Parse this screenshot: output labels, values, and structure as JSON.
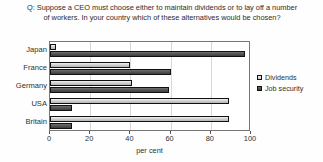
{
  "chart_data": {
    "type": "bar",
    "orientation": "horizontal",
    "title": "Q: Suppose a CEO must choose either to maintain dividends or to lay off a number of workers. In your country which of these alternatives would be chosen?",
    "xlabel": "per cent",
    "ylabel": "",
    "categories": [
      "Japan",
      "France",
      "Germany",
      "USA",
      "Britain"
    ],
    "series": [
      {
        "name": "Dividends",
        "values": [
          3,
          40,
          41,
          89,
          89
        ],
        "color": "#d2d2d2"
      },
      {
        "name": "Job security",
        "values": [
          97,
          60,
          59,
          11,
          11
        ],
        "color": "#4c4c4c"
      }
    ],
    "xlim": [
      0,
      100
    ],
    "xticks": [
      0,
      20,
      40,
      60,
      80,
      100
    ],
    "xtick_labels": [
      "0",
      "20",
      "40",
      "60",
      "80",
      "100"
    ],
    "grid": true,
    "legend_position": "right"
  },
  "legend": {
    "entries": [
      {
        "label": "Dividends"
      },
      {
        "label": "Job security"
      }
    ]
  }
}
